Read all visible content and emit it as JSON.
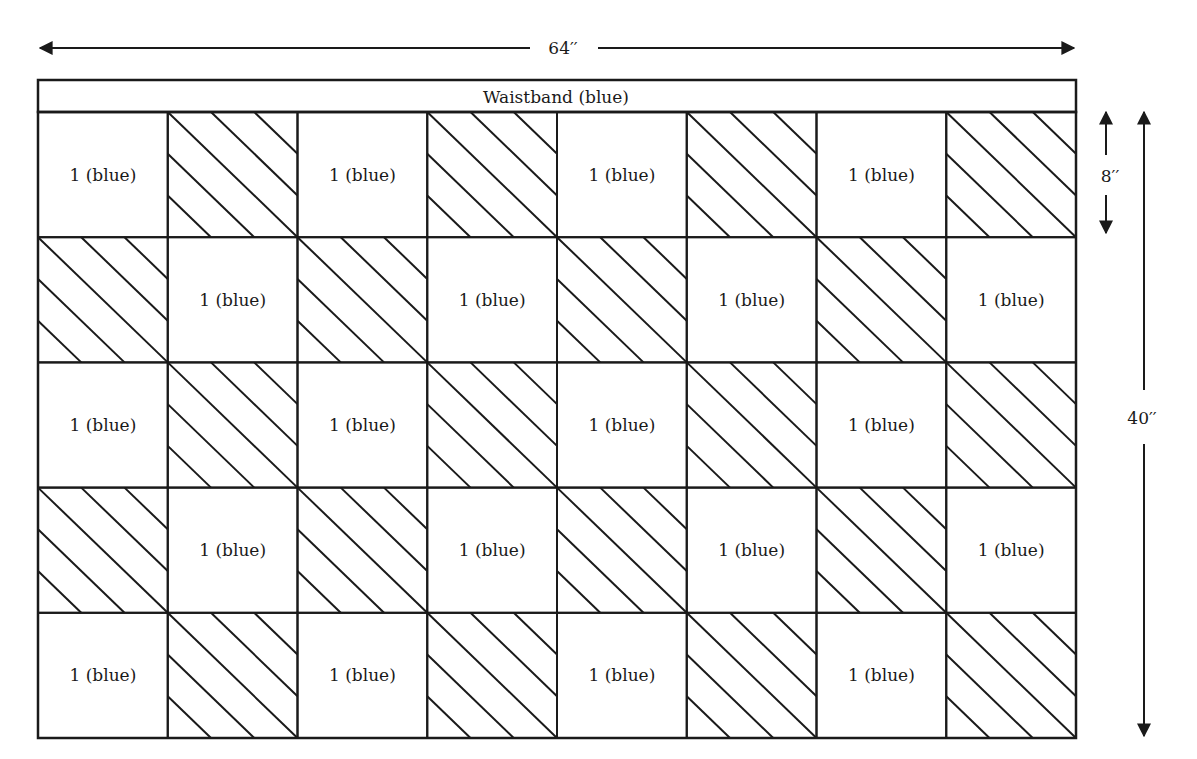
{
  "diagram": {
    "waistband_label": "Waistband (blue)",
    "width_label": "64′′",
    "square_height_label": "8′′",
    "total_height_label": "40′′",
    "grid": {
      "columns": 8,
      "rows": 5,
      "plain_label": "1 (blue)",
      "pattern": "checkerboard; plain squares at (row+col) even, hatched squares otherwise",
      "hatch_direction": "diagonal top-left to bottom-right"
    },
    "cells": [
      [
        "1 (blue)",
        "hatched",
        "1 (blue)",
        "hatched",
        "1 (blue)",
        "hatched",
        "1 (blue)",
        "hatched"
      ],
      [
        "hatched",
        "1 (blue)",
        "hatched",
        "1 (blue)",
        "hatched",
        "1 (blue)",
        "hatched",
        "1 (blue)"
      ],
      [
        "1 (blue)",
        "hatched",
        "1 (blue)",
        "hatched",
        "1 (blue)",
        "hatched",
        "1 (blue)",
        "hatched"
      ],
      [
        "hatched",
        "1 (blue)",
        "hatched",
        "1 (blue)",
        "hatched",
        "1 (blue)",
        "hatched",
        "1 (blue)"
      ],
      [
        "1 (blue)",
        "hatched",
        "1 (blue)",
        "hatched",
        "1 (blue)",
        "hatched",
        "1 (blue)",
        "hatched"
      ]
    ],
    "line_color": "#1a1a1a"
  }
}
